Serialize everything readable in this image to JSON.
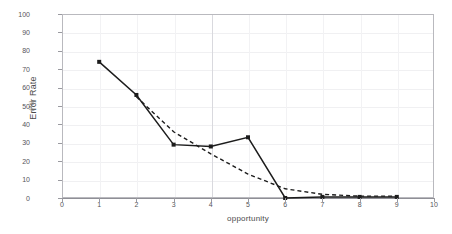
{
  "chart_data": {
    "type": "line",
    "title": "",
    "xlabel": "opportunity",
    "ylabel": "Error Rate",
    "ylabel_units": "(%)",
    "xlim": [
      0,
      10
    ],
    "ylim": [
      0,
      100
    ],
    "x_ticks": [
      0,
      1,
      2,
      3,
      4,
      5,
      6,
      7,
      8,
      9,
      10
    ],
    "y_ticks": [
      0,
      10,
      20,
      30,
      40,
      50,
      60,
      70,
      80,
      90,
      100
    ],
    "grid": true,
    "legend": "none",
    "series": [
      {
        "name": "observed",
        "style": "solid-with-square-markers",
        "color": "#1c1c1c",
        "x": [
          1,
          2,
          3,
          4,
          5,
          6,
          7,
          8,
          9
        ],
        "values": [
          74,
          56,
          29,
          28,
          33,
          0,
          0.6,
          0.6,
          0.6
        ]
      },
      {
        "name": "fitted",
        "style": "dashed",
        "color": "#1c1c1c",
        "x": [
          2,
          3,
          4,
          5,
          6,
          7,
          8,
          9
        ],
        "values": [
          55,
          36,
          24,
          13,
          5,
          2,
          1,
          1
        ]
      }
    ]
  },
  "axes": {
    "x_title": "opportunity",
    "y_title": "Error Rate",
    "y_units": "(%)"
  }
}
